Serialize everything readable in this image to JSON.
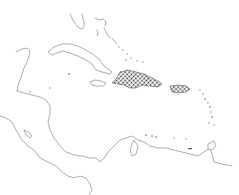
{
  "map": {
    "region": "Caribbean",
    "style": "outline locator map",
    "highlighted_regions": [
      "Hispaniola",
      "Puerto Rico"
    ],
    "highlight_pattern": "crosshatch-dots",
    "colors": {
      "background": "#ffffff",
      "coastline": "#8a8a8a",
      "highlight": "#333333"
    },
    "labels": []
  }
}
